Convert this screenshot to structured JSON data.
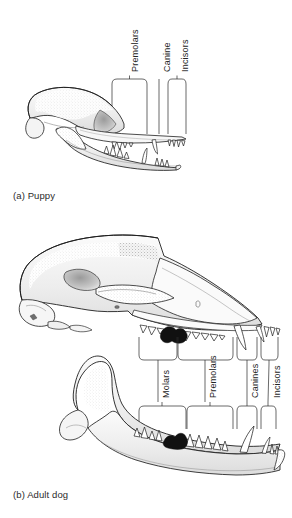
{
  "figure": {
    "title_implicit": "Dog dentition: deciduous versus permanent teeth",
    "background_color": "#ffffff",
    "line_color": "#1a1a1a",
    "shade_color": "#d8d8d8",
    "fill_dark_color": "#111111"
  },
  "panels": [
    {
      "id": "puppy",
      "caption": "(a) Puppy",
      "labels": [
        {
          "name": "premolars",
          "text": "Premolars",
          "x": 128,
          "y": 72,
          "bracket": {
            "x": 112,
            "y": 79,
            "w": 35,
            "h": 55,
            "tick": true
          }
        },
        {
          "name": "canine",
          "text": "Canine",
          "x": 157,
          "y": 72,
          "bracket": {
            "x": 159,
            "y": 79,
            "w": 0,
            "h": 55,
            "tick": false
          }
        },
        {
          "name": "incisors",
          "text": "Incisors",
          "x": 177,
          "y": 72,
          "bracket": {
            "x": 168,
            "y": 79,
            "w": 18,
            "h": 55,
            "tick": true
          }
        }
      ]
    },
    {
      "id": "adult_dog",
      "caption": "(b) Adult dog",
      "labels": [
        {
          "name": "molars",
          "text": "Molars",
          "x": 158,
          "y": 368,
          "bracket_upper": {
            "x": 139,
            "y": 337,
            "w": 38,
            "h": 23
          },
          "bracket_lower": {
            "x": 139,
            "y": 406,
            "w": 47,
            "h": 23
          }
        },
        {
          "name": "premolars",
          "text": "Premolars",
          "x": 200,
          "y": 368,
          "bracket_upper": {
            "x": 177,
            "y": 337,
            "w": 56,
            "h": 23
          },
          "bracket_lower": {
            "x": 186,
            "y": 406,
            "w": 47,
            "h": 23
          }
        },
        {
          "name": "canines",
          "text": "Canines",
          "x": 243,
          "y": 368,
          "bracket_upper": {
            "x": 237,
            "y": 337,
            "w": 20,
            "h": 23
          },
          "bracket_lower": {
            "x": 237,
            "y": 406,
            "w": 20,
            "h": 23
          }
        },
        {
          "name": "incisors",
          "text": "Incisors",
          "x": 264,
          "y": 368,
          "bracket_upper": {
            "x": 261,
            "y": 337,
            "w": 17,
            "h": 23
          },
          "bracket_lower": {
            "x": 261,
            "y": 406,
            "w": 14,
            "h": 23
          }
        }
      ]
    }
  ]
}
